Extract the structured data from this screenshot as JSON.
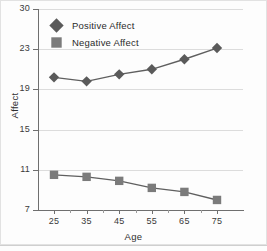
{
  "chart_data": {
    "type": "line",
    "title": "",
    "xlabel": "Age",
    "ylabel": "Affect",
    "x": [
      25,
      35,
      45,
      55,
      65,
      75
    ],
    "xtick_labels": [
      "25",
      "35",
      "45",
      "55",
      "65",
      "75"
    ],
    "ytick_labels": [
      "30",
      "23",
      "19",
      "15",
      "11",
      "7"
    ],
    "ytick_values": [
      30,
      23,
      19,
      15,
      11,
      7
    ],
    "ylim": [
      7,
      30
    ],
    "xlim": [
      20,
      80
    ],
    "grid": "horizontal",
    "legend_position": "top-left",
    "series": [
      {
        "name": "Positive Affect",
        "marker": "diamond",
        "color": "#5a5a5a",
        "values": [
          20.2,
          19.8,
          20.5,
          21.0,
          22.0,
          23.2
        ]
      },
      {
        "name": "Negative Affect",
        "marker": "square",
        "color": "#7b7b7b",
        "values": [
          10.5,
          10.3,
          9.9,
          9.2,
          8.8,
          8.0
        ]
      }
    ]
  },
  "legend": {
    "items": [
      {
        "label": "Positive Affect",
        "icon": "diamond-marker-icon"
      },
      {
        "label": "Negative Affect",
        "icon": "square-marker-icon"
      }
    ]
  },
  "axes": {
    "x_title": "Age",
    "y_title": "Affect"
  }
}
